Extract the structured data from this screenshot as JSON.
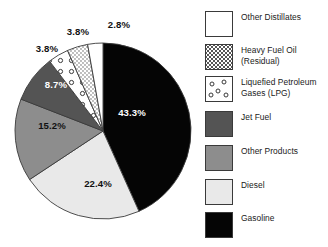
{
  "chart_data": {
    "type": "pie",
    "title": "",
    "xlabel": "",
    "ylabel": "",
    "unit": "percent",
    "start_angle_deg": 0,
    "direction": "clockwise",
    "legend_position": "right",
    "grid": false,
    "categories": [
      "Gasoline",
      "Diesel",
      "Other Products",
      "Jet Fuel",
      "Liquefied Petroleum Gases (LPG)",
      "Heavy Fuel Oil (Residual)",
      "Other Distillates"
    ],
    "values": [
      43.3,
      22.4,
      15.2,
      8.7,
      3.8,
      3.8,
      2.8
    ],
    "data_labels": [
      "43.3%",
      "22.4%",
      "15.2%",
      "8.7%",
      "3.8%",
      "3.8%",
      "2.8%"
    ],
    "slices": [
      {
        "name": "Gasoline",
        "value": 43.3,
        "label": "43.3%",
        "fill": "#050505",
        "pattern": "solid",
        "label_color": "#ffffff",
        "label_x": 132,
        "label_y": 112
      },
      {
        "name": "Diesel",
        "value": 22.4,
        "label": "22.4%",
        "fill": "#e9e9e9",
        "pattern": "solid",
        "label_color": "#111111",
        "label_x": 98,
        "label_y": 183
      },
      {
        "name": "Other Products",
        "value": 15.2,
        "label": "15.2%",
        "fill": "#8d8d8d",
        "pattern": "solid",
        "label_color": "#111111",
        "label_x": 52,
        "label_y": 125
      },
      {
        "name": "Jet Fuel",
        "value": 8.7,
        "label": "8.7%",
        "fill": "#545454",
        "pattern": "solid",
        "label_color": "#ffffff",
        "label_x": 56,
        "label_y": 84
      },
      {
        "name": "Liquefied Petroleum Gases (LPG)",
        "value": 3.8,
        "label": "3.8%",
        "fill": "#ffffff",
        "pattern": "circles",
        "label_color": "#111111",
        "label_x": 47,
        "label_y": 48
      },
      {
        "name": "Heavy Fuel Oil (Residual)",
        "value": 3.8,
        "label": "3.8%",
        "fill": "#ffffff",
        "pattern": "stipple",
        "label_color": "#111111",
        "label_x": 78,
        "label_y": 31
      },
      {
        "name": "Other Distillates",
        "value": 2.8,
        "label": "2.8%",
        "fill": "#ffffff",
        "pattern": "solid",
        "label_color": "#111111",
        "label_x": 119,
        "label_y": 24
      }
    ]
  },
  "legend": {
    "items": [
      {
        "label": "Other Distillates",
        "fill": "#ffffff",
        "pattern": "solid",
        "y": 11
      },
      {
        "label": "Heavy Fuel Oil\n(Residual)",
        "fill": "#ffffff",
        "pattern": "stipple",
        "y": 44
      },
      {
        "label": "Liquefied Petroleum\nGases (LPG)",
        "fill": "#ffffff",
        "pattern": "circles",
        "y": 76
      },
      {
        "label": "Jet Fuel",
        "fill": "#545454",
        "pattern": "solid",
        "y": 111
      },
      {
        "label": "Other Products",
        "fill": "#8d8d8d",
        "pattern": "solid",
        "y": 145
      },
      {
        "label": "Diesel",
        "fill": "#e9e9e9",
        "pattern": "solid",
        "y": 179
      },
      {
        "label": "Gasoline",
        "fill": "#050505",
        "pattern": "solid",
        "y": 212
      }
    ]
  },
  "colors": {
    "gasoline": "#050505",
    "diesel": "#e9e9e9",
    "other_products": "#8d8d8d",
    "jet_fuel": "#545454",
    "outline": "#3a3a3a",
    "background": "#ffffff"
  }
}
